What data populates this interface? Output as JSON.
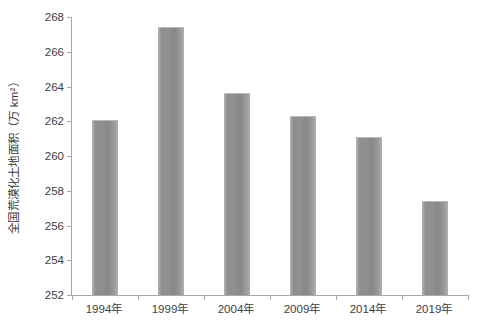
{
  "chart_data": {
    "type": "bar",
    "title": "",
    "subtitle": "",
    "xlabel": "",
    "ylabel": "全国荒漠化土地面积（万 km²）",
    "categories": [
      "1994年",
      "1999年",
      "2004年",
      "2009年",
      "2014年",
      "2019年"
    ],
    "values": [
      262.1,
      267.4,
      263.6,
      262.3,
      261.1,
      257.4
    ],
    "series": [
      {
        "name": "全国荒漠化土地面积",
        "values": [
          262.1,
          267.4,
          263.6,
          262.3,
          261.1,
          257.4
        ]
      }
    ],
    "ylim": [
      252,
      268
    ],
    "ytick_step": 2,
    "yticks": [
      252,
      254,
      256,
      258,
      260,
      262,
      264,
      266,
      268
    ],
    "ytick_labels": [
      "252",
      "254",
      "256",
      "258",
      "260",
      "262",
      "264",
      "266",
      "268"
    ],
    "grid": false,
    "legend": false,
    "legend_position": "none",
    "bar_color": "#8e8e8e",
    "axis_color": "#a8a8a8",
    "background_color": "#ffffff",
    "text_color": "#404040"
  }
}
